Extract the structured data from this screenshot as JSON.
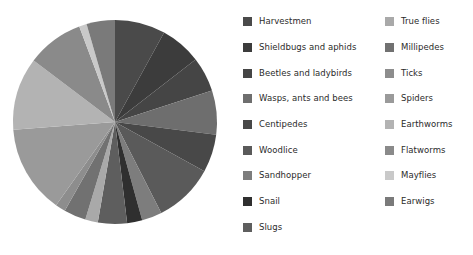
{
  "chart_data": {
    "type": "pie",
    "title": "",
    "subtitle": "",
    "xlabel": "",
    "ylabel": "",
    "grid": false,
    "legend_position": "right",
    "legend_columns": 2,
    "start_angle_deg": 90,
    "direction": "clockwise",
    "categories": [
      "Harvestmen",
      "Shieldbugs and aphids",
      "Beetles and ladybirds",
      "Wasps, ants and bees",
      "Centipedes",
      "Woodlice",
      "Sandhopper",
      "Snail",
      "Slugs",
      "True flies",
      "Millipedes",
      "Ticks",
      "Spiders",
      "Earthworms",
      "Flatworms",
      "Mayflies",
      "Earwigs"
    ],
    "values": [
      8.0,
      6.5,
      5.5,
      7.0,
      6.0,
      9.5,
      3.2,
      2.4,
      4.6,
      2.0,
      3.5,
      1.6,
      14.0,
      11.5,
      9.0,
      1.2,
      4.5
    ],
    "colors": [
      "#4a4a4a",
      "#3c3c3c",
      "#454545",
      "#6e6e6e",
      "#484848",
      "#5a5a5a",
      "#7d7d7d",
      "#2f2f2f",
      "#5e5e5e",
      "#a9a9a9",
      "#717171",
      "#8d8d8d",
      "#9a9a9a",
      "#b3b3b3",
      "#8a8a8a",
      "#c9c9c9",
      "#7a7a7a"
    ]
  },
  "legend": {
    "column_left": [
      {
        "label": "Harvestmen",
        "color": "#4a4a4a"
      },
      {
        "label": "Shieldbugs and aphids",
        "color": "#3c3c3c"
      },
      {
        "label": "Beetles and ladybirds",
        "color": "#454545"
      },
      {
        "label": "Wasps, ants and bees",
        "color": "#6e6e6e"
      },
      {
        "label": "Centipedes",
        "color": "#484848"
      },
      {
        "label": "Woodlice",
        "color": "#5a5a5a"
      },
      {
        "label": "Sandhopper",
        "color": "#7d7d7d"
      },
      {
        "label": "Snail",
        "color": "#2f2f2f"
      },
      {
        "label": "Slugs",
        "color": "#5e5e5e"
      }
    ],
    "column_right": [
      {
        "label": "True flies",
        "color": "#a9a9a9"
      },
      {
        "label": "Millipedes",
        "color": "#717171"
      },
      {
        "label": "Ticks",
        "color": "#8d8d8d"
      },
      {
        "label": "Spiders",
        "color": "#9a9a9a"
      },
      {
        "label": "Earthworms",
        "color": "#b3b3b3"
      },
      {
        "label": "Flatworms",
        "color": "#8a8a8a"
      },
      {
        "label": "Mayflies",
        "color": "#c9c9c9"
      },
      {
        "label": "Earwigs",
        "color": "#7a7a7a"
      }
    ]
  },
  "pie_geometry": {
    "center_x": 115,
    "center_y": 122,
    "radius": 102
  }
}
